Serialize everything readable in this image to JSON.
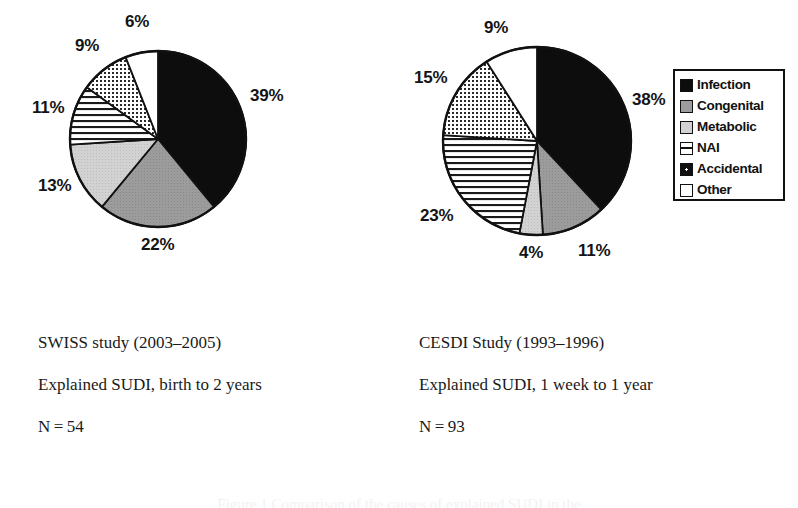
{
  "figure": {
    "type": "pie-pair",
    "background": "#ffffff",
    "caption_partial": "Figure 1  Comparison of the causes of explained SUDI in the"
  },
  "categories": [
    {
      "key": "infection",
      "label": "Infection",
      "pattern": "solid-black",
      "color": "#0d0d0d"
    },
    {
      "key": "congenital",
      "label": "Congenital",
      "pattern": "mid-gray",
      "color": "#9a9a9a"
    },
    {
      "key": "metabolic",
      "label": "Metabolic",
      "pattern": "light-gray",
      "color": "#cfcfcf"
    },
    {
      "key": "nai",
      "label": "NAI",
      "pattern": "horizontal-lines",
      "color": "#ffffff"
    },
    {
      "key": "accidental",
      "label": "Accidental",
      "pattern": "dotted-grid",
      "color": "#ffffff"
    },
    {
      "key": "other",
      "label": "Other",
      "pattern": "white",
      "color": "#ffffff"
    }
  ],
  "legend": {
    "title": "",
    "items": [
      "Infection",
      "Congenital",
      "Metabolic",
      "NAI",
      "Accidental",
      "Other"
    ]
  },
  "chart_data": [
    {
      "type": "pie",
      "id": "swiss",
      "title": "SWISS study (2003–2005)",
      "subtitle": "Explained SUDI, birth to 2 years",
      "n_label": "N = 54",
      "n": 54,
      "categories": [
        "Infection",
        "Congenital",
        "Metabolic",
        "NAI",
        "Accidental",
        "Other"
      ],
      "values": [
        39,
        22,
        13,
        11,
        9,
        6
      ],
      "unit": "%",
      "labels": [
        "39%",
        "22%",
        "13%",
        "11%",
        "9%",
        "6%"
      ],
      "start_angle_deg": 0,
      "direction": "clockwise",
      "center": {
        "x": 158,
        "y": 139
      },
      "radius": 88,
      "label_positions": [
        {
          "text": "39%",
          "x": 250,
          "y": 86
        },
        {
          "text": "22%",
          "x": 141,
          "y": 235
        },
        {
          "text": "13%",
          "x": 38,
          "y": 176
        },
        {
          "text": "11%",
          "x": 32,
          "y": 98
        },
        {
          "text": "9%",
          "x": 75,
          "y": 36
        },
        {
          "text": "6%",
          "x": 125,
          "y": 12
        }
      ]
    },
    {
      "type": "pie",
      "id": "cesdi",
      "title": "CESDI Study (1993–1996)",
      "subtitle": "Explained SUDI, 1 week to 1 year",
      "n_label": "N = 93",
      "n": 93,
      "categories": [
        "Infection",
        "Congenital",
        "Metabolic",
        "NAI",
        "Accidental",
        "Other"
      ],
      "values": [
        38,
        11,
        4,
        23,
        15,
        9
      ],
      "unit": "%",
      "labels": [
        "38%",
        "11%",
        "4%",
        "23%",
        "15%",
        "9%"
      ],
      "start_angle_deg": 0,
      "direction": "clockwise",
      "center": {
        "x": 537,
        "y": 141
      },
      "radius": 94,
      "label_positions": [
        {
          "text": "38%",
          "x": 632,
          "y": 90
        },
        {
          "text": "11%",
          "x": 578,
          "y": 241
        },
        {
          "text": "4%",
          "x": 519,
          "y": 243
        },
        {
          "text": "23%",
          "x": 420,
          "y": 206
        },
        {
          "text": "15%",
          "x": 414,
          "y": 68
        },
        {
          "text": "9%",
          "x": 484,
          "y": 18
        }
      ]
    }
  ],
  "captions": [
    {
      "id": "swiss-caption",
      "x": 38,
      "y": 333,
      "lines": [
        "SWISS study (2003–2005)",
        "Explained SUDI, birth to 2 years",
        "N = 54"
      ]
    },
    {
      "id": "cesdi-caption",
      "x": 419,
      "y": 333,
      "lines": [
        "CESDI Study (1993–1996)",
        "Explained SUDI, 1 week to 1 year",
        "N = 93"
      ]
    }
  ]
}
